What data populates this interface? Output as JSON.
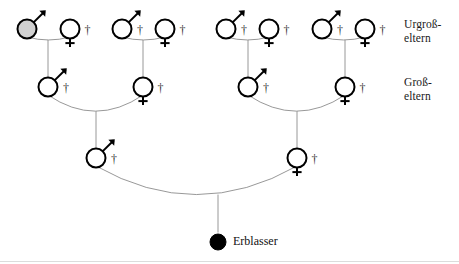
{
  "diagram": {
    "type": "genealogy-pedigree",
    "title_visible": false,
    "background_color": "#ffffff",
    "line_color": "#8c8c8c",
    "symbol_stroke_color": "#000000",
    "shaded_fill_color": "#d0d0d0",
    "solid_fill_color": "#000000",
    "dagger_glyph": "†",
    "generation_labels": [
      {
        "id": "great-grandparents",
        "line1": "Urgroß-",
        "line2": "eltern",
        "x": 404,
        "y": 18
      },
      {
        "id": "grandparents",
        "line1": "Groß-",
        "line2": "eltern",
        "x": 404,
        "y": 76
      }
    ],
    "focus": {
      "id": "erblasser",
      "label": "Erblasser",
      "symbol": "filled-circle",
      "x": 218,
      "y": 242,
      "radius": 8,
      "fill": "#000000",
      "deceased": false
    },
    "generations": [
      {
        "id": "great-grandparents",
        "row_y": 29,
        "radius": 9.5,
        "persons": [
          {
            "id": "ggp-1-m",
            "sex": "male",
            "x": 27,
            "deceased": false,
            "shaded": true
          },
          {
            "id": "ggp-1-f",
            "sex": "female",
            "x": 70,
            "deceased": true,
            "shaded": false
          },
          {
            "id": "ggp-2-m",
            "sex": "male",
            "x": 122,
            "deceased": true,
            "shaded": false
          },
          {
            "id": "ggp-2-f",
            "sex": "female",
            "x": 165,
            "deceased": true,
            "shaded": false
          },
          {
            "id": "ggp-3-m",
            "sex": "male",
            "x": 226,
            "deceased": true,
            "shaded": false
          },
          {
            "id": "ggp-3-f",
            "sex": "female",
            "x": 269,
            "deceased": true,
            "shaded": false
          },
          {
            "id": "ggp-4-m",
            "sex": "male",
            "x": 322,
            "deceased": true,
            "shaded": false
          },
          {
            "id": "ggp-4-f",
            "sex": "female",
            "x": 365,
            "deceased": true,
            "shaded": false
          }
        ]
      },
      {
        "id": "grandparents",
        "row_y": 87,
        "radius": 9.5,
        "persons": [
          {
            "id": "gp-1-m",
            "sex": "male",
            "x": 48,
            "deceased": true,
            "shaded": false
          },
          {
            "id": "gp-2-f",
            "sex": "female",
            "x": 143,
            "deceased": true,
            "shaded": false
          },
          {
            "id": "gp-3-m",
            "sex": "male",
            "x": 248,
            "deceased": true,
            "shaded": false
          },
          {
            "id": "gp-4-f",
            "sex": "female",
            "x": 345,
            "deceased": true,
            "shaded": false
          }
        ]
      },
      {
        "id": "parents",
        "row_y": 158,
        "radius": 9.5,
        "persons": [
          {
            "id": "parent-father",
            "sex": "male",
            "x": 96,
            "deceased": true,
            "shaded": false
          },
          {
            "id": "parent-mother",
            "sex": "female",
            "x": 297,
            "deceased": true,
            "shaded": false
          }
        ]
      }
    ],
    "unions": [
      {
        "id": "union-ggp-1",
        "left_x": 27,
        "right_x": 70,
        "y": 29,
        "child_x": 48,
        "child_y": 87,
        "arc_depth": 9
      },
      {
        "id": "union-ggp-2",
        "left_x": 122,
        "right_x": 165,
        "y": 29,
        "child_x": 143,
        "child_y": 87,
        "arc_depth": 9
      },
      {
        "id": "union-ggp-3",
        "left_x": 226,
        "right_x": 269,
        "y": 29,
        "child_x": 248,
        "child_y": 87,
        "arc_depth": 9
      },
      {
        "id": "union-ggp-4",
        "left_x": 322,
        "right_x": 365,
        "y": 29,
        "child_x": 345,
        "child_y": 87,
        "arc_depth": 9
      },
      {
        "id": "union-gp-left",
        "left_x": 48,
        "right_x": 143,
        "y": 87,
        "child_x": 96,
        "child_y": 158,
        "arc_depth": 26
      },
      {
        "id": "union-gp-right",
        "left_x": 248,
        "right_x": 345,
        "y": 87,
        "child_x": 297,
        "child_y": 158,
        "arc_depth": 26
      },
      {
        "id": "union-parents",
        "left_x": 96,
        "right_x": 297,
        "y": 158,
        "child_x": 218,
        "child_y": 242,
        "arc_depth": 42
      }
    ]
  }
}
